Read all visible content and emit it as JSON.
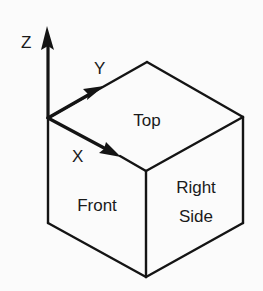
{
  "diagram": {
    "title": "",
    "faces": {
      "top": "Top",
      "front": "Front",
      "right_line1": "Right",
      "right_line2": "Side"
    },
    "axes": {
      "x": "X",
      "y": "Y",
      "z": "Z"
    },
    "colors": {
      "background": "#fbfbfb",
      "stroke": "#141414",
      "text": "#1a1a1a"
    }
  }
}
